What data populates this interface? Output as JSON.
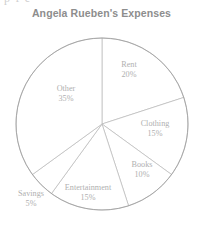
{
  "page": {
    "clipped_top_text": "p f e",
    "background_color": "#ffffff"
  },
  "chart_data": {
    "type": "pie",
    "title": "Angela Rueben's Expenses",
    "xlabel": "",
    "ylabel": "",
    "legend_position": "none",
    "labels_inside": true,
    "start_angle_deg": 90,
    "direction": "clockwise",
    "categories": [
      "Rent",
      "Clothing",
      "Books",
      "Entertainment",
      "Savings",
      "Other"
    ],
    "values": [
      20,
      15,
      10,
      15,
      5,
      35
    ],
    "value_suffix": "%",
    "slices": [
      {
        "label": "Rent",
        "value": 20,
        "percent_text": "20%",
        "label_x": 129,
        "label_y": 67,
        "slice_fill": "#ffffff"
      },
      {
        "label": "Clothing",
        "value": 15,
        "percent_text": "15%",
        "label_x": 155,
        "label_y": 126,
        "slice_fill": "#ffffff"
      },
      {
        "label": "Books",
        "value": 10,
        "percent_text": "10%",
        "label_x": 142,
        "label_y": 167,
        "slice_fill": "#ffffff"
      },
      {
        "label": "Entertainment",
        "value": 15,
        "percent_text": "15%",
        "label_x": 88,
        "label_y": 190,
        "slice_fill": "#ffffff"
      },
      {
        "label": "Savings",
        "value": 5,
        "percent_text": "5%",
        "label_x": 31,
        "label_y": 196,
        "slice_fill": "#ffffff"
      },
      {
        "label": "Other",
        "value": 35,
        "percent_text": "35%",
        "label_x": 66,
        "label_y": 91,
        "slice_fill": "#ffffff"
      }
    ],
    "total": 100,
    "geometry": {
      "center_x": 102,
      "center_y": 124,
      "radius": 86
    },
    "colors": {
      "outline": "#9a9a9a",
      "divider": "#b9b9b9",
      "label_text": "#b0b0b0",
      "title_text": "#8d8d8d"
    }
  }
}
